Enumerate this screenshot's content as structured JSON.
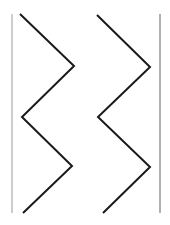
{
  "figure": {
    "width": 170,
    "height": 225,
    "background": "#ffffff",
    "boundary_lines": [
      {
        "name": "left-boundary",
        "x1": 12,
        "y1": 14,
        "x2": 12,
        "y2": 213,
        "color": "#9a9a9a",
        "width": 1
      },
      {
        "name": "right-boundary",
        "x1": 160,
        "y1": 14,
        "x2": 160,
        "y2": 213,
        "color": "#7a7a7a",
        "width": 1.2
      }
    ],
    "zigzags": [
      {
        "name": "left-zigzag",
        "points": "20,14 74,66 22,117 72,166 23,213",
        "color": "#1a1a1a",
        "width": 2
      },
      {
        "name": "right-zigzag",
        "points": "97,15 150,67 98,117 150,167 103,213",
        "color": "#1a1a1a",
        "width": 2
      }
    ]
  }
}
